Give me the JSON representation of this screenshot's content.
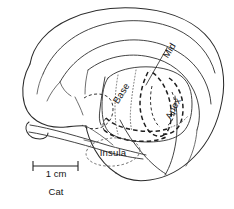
{
  "figure": {
    "kind": "anatomical-line-drawing",
    "species_label": "Cat",
    "background_color": "#ffffff",
    "ink_color": "#2b2b2b"
  },
  "labels": {
    "base": "Base",
    "mid": "Mid",
    "apex": "Apex",
    "insula": "Insula"
  },
  "label_details": [
    {
      "text": "Base",
      "rotation_deg": -58,
      "x": 124,
      "y": 92,
      "style": "rotated-diagonal"
    },
    {
      "text": "Mid",
      "rotation_deg": -58,
      "x": 170,
      "y": 58,
      "style": "rotated-diagonal-with-leader"
    },
    {
      "text": "Apex",
      "rotation_deg": -62,
      "x": 177,
      "y": 110,
      "style": "rotated-diagonal"
    },
    {
      "text": "Insula",
      "rotation_deg": 0,
      "x": 113,
      "y": 152,
      "style": "horizontal-in-ellipse"
    }
  ],
  "scale": {
    "length_label": "1 cm",
    "bar_x_start": 33,
    "bar_x_end": 78,
    "bar_y": 166,
    "pixel_length": 45
  },
  "regions": [
    {
      "name": "Base",
      "line_style": "dotted",
      "meaning": "cochlear base representation (high frequency)"
    },
    {
      "name": "Mid",
      "line_style": "dashed",
      "meaning": "cochlear mid representation"
    },
    {
      "name": "Apex",
      "line_style": "dashed",
      "meaning": "cochlear apex representation (low frequency)"
    },
    {
      "name": "Insula",
      "line_style": "fine-dashed-ellipse",
      "meaning": "insular cortex field"
    }
  ]
}
